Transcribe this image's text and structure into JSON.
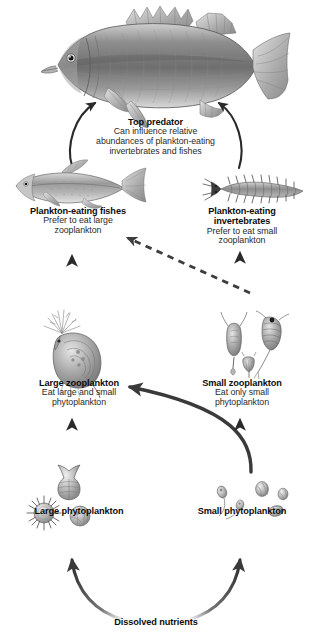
{
  "diagram": {
    "background_color": "#ffffff",
    "ink_color": "#1c1c1c"
  },
  "nodes": {
    "top_predator": {
      "title": "Top predator",
      "line1": "Can influence relative",
      "line2": "abundances of plankton-eating",
      "line3": "invertebrates and fishes",
      "organism_icon": "large-predatory-fish-icon"
    },
    "plankton_eating_fishes": {
      "title": "Plankton-eating fishes",
      "line1": "Prefer to eat large",
      "line2": "zooplankton",
      "organism_icon": "small-silvery-fish-icon"
    },
    "plankton_eating_invertebrates": {
      "title_line1": "Plankton-eating",
      "title_line2": "invertebrates",
      "line1": "Prefer to eat small",
      "line2": "zooplankton",
      "organism_icon": "bristle-worm-icon"
    },
    "large_zooplankton": {
      "title": "Large zooplankton",
      "line1": "Eat large and small",
      "line2": "phytoplankton",
      "organism_icon": "large-daphnia-icon"
    },
    "small_zooplankton": {
      "title": "Small zooplankton",
      "line1": "Eat only small",
      "line2": "phytoplankton",
      "organism_icon": "rotifer-copepod-cluster-icon"
    },
    "large_phytoplankton": {
      "title": "Large phytoplankton",
      "organism_icon": "diatom-colony-icon"
    },
    "small_phytoplankton": {
      "title": "Small phytoplankton",
      "organism_icon": "flagellate-cluster-icon"
    },
    "dissolved_nutrients": {
      "title": "Dissolved nutrients"
    }
  },
  "arrows": [
    {
      "name": "fishes-to-top-predator",
      "style": "solid-curved",
      "from": "plankton_eating_fishes",
      "to": "top_predator"
    },
    {
      "name": "invertebrates-to-top-predator",
      "style": "solid-curved",
      "from": "plankton_eating_invertebrates",
      "to": "top_predator"
    },
    {
      "name": "large-zoo-to-fishes",
      "style": "solid-straight",
      "from": "large_zooplankton",
      "to": "plankton_eating_fishes"
    },
    {
      "name": "small-zoo-to-invertebrates",
      "style": "solid-straight",
      "from": "small_zooplankton",
      "to": "plankton_eating_invertebrates"
    },
    {
      "name": "small-zoo-to-fishes",
      "style": "dashed",
      "from": "small_zooplankton",
      "to": "plankton_eating_fishes"
    },
    {
      "name": "small-zoo-to-large-zoo",
      "style": "solid-curved",
      "from": "small_zooplankton",
      "to": "large_zooplankton"
    },
    {
      "name": "large-phyto-to-large-zoo",
      "style": "solid-straight",
      "from": "large_phytoplankton",
      "to": "large_zooplankton"
    },
    {
      "name": "small-phyto-to-small-zoo",
      "style": "solid-straight",
      "from": "small_phytoplankton",
      "to": "small_zooplankton"
    },
    {
      "name": "nutrients-to-large-phyto",
      "style": "solid-curved",
      "from": "dissolved_nutrients",
      "to": "large_phytoplankton"
    },
    {
      "name": "nutrients-to-small-phyto",
      "style": "solid-curved",
      "from": "dissolved_nutrients",
      "to": "small_phytoplankton"
    }
  ]
}
